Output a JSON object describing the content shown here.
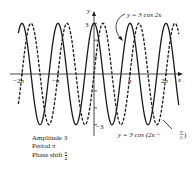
{
  "chart_data": {
    "type": "line",
    "title": "",
    "xlabel": "x",
    "ylabel": "y",
    "xlim": [
      -6.9,
      7.5
    ],
    "ylim": [
      -3.2,
      3.2
    ],
    "grid": false,
    "x_ticks": [
      {
        "value": -6.2832,
        "label": "−2π"
      },
      {
        "value": -3.1416,
        "label": "−π"
      },
      {
        "value": 3.1416,
        "label": "π"
      },
      {
        "value": 6.2832,
        "label": "2π"
      }
    ],
    "y_ticks": [
      {
        "value": 3,
        "label": "3"
      },
      {
        "value": 2,
        "label": ""
      },
      {
        "value": 1,
        "label": ""
      },
      {
        "value": -1,
        "label": ""
      },
      {
        "value": -2,
        "label": ""
      },
      {
        "value": -3,
        "label": "−3"
      }
    ],
    "series": [
      {
        "name": "y = 3 cos 2x",
        "style": "solid",
        "amplitude": 3,
        "frequency": 2,
        "phase": 0,
        "x_range": [
          -6.6,
          7.4
        ]
      },
      {
        "name": "y = 3 cos (2x − π/2)",
        "style": "dashed",
        "amplitude": 3,
        "frequency": 2,
        "phase": 1.5708,
        "x_range": [
          -6.6,
          7.4
        ]
      }
    ],
    "annotations": [
      {
        "text": "y = 3 cos 2x",
        "points_to": "solid"
      },
      {
        "text": "y = 3 cos (2x − π/2)",
        "points_to": "dashed"
      }
    ],
    "properties": {
      "amplitude": "Amplitude 3",
      "period": "Period π",
      "phase_shift_label": "Phase shift",
      "phase_shift_num": "π",
      "phase_shift_den": "4"
    }
  },
  "labels": {
    "y_axis": "y",
    "x_axis": "x",
    "y_top": "3",
    "y_bottom": "−3",
    "neg_2pi": "−2π",
    "neg_pi": "−π",
    "pi": "π",
    "two_pi": "2π",
    "solid_eq": "y = 3 cos 2x",
    "dashed_eq_prefix": "y = 3 cos (2x −",
    "dashed_eq_num": "π",
    "dashed_eq_den": "2",
    "dashed_eq_suffix": ")"
  }
}
